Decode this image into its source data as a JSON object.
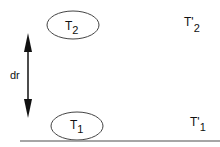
{
  "diagram": {
    "top_ellipse": {
      "label": "T",
      "sub": "2"
    },
    "bottom_ellipse": {
      "label": "T",
      "sub": "1"
    },
    "top_right": {
      "label": "T'",
      "sub": "2"
    },
    "bottom_right": {
      "label": "T'",
      "sub": "1"
    },
    "arrow_label": "dr",
    "colors": {
      "stroke": "#111111",
      "ellipse": "#444444",
      "baseline": "#888888"
    }
  }
}
